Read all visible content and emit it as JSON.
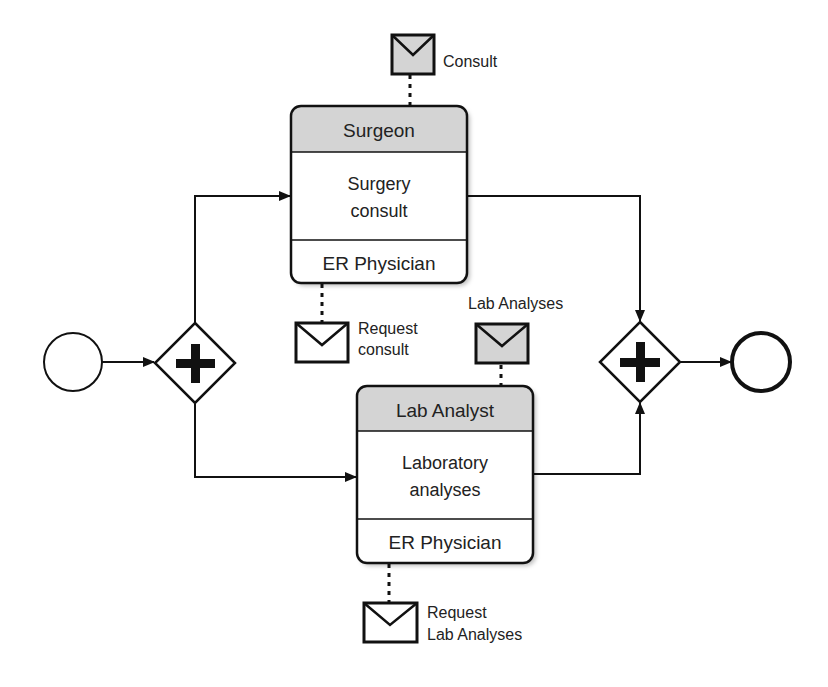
{
  "diagram": {
    "type": "BPMN choreography",
    "colors": {
      "stroke": "#111111",
      "header_fill": "#d4d4d4",
      "envelope_fill_initiating": "#ffffff",
      "envelope_fill_return": "#d4d4d4",
      "background": "#ffffff"
    },
    "start_event": {
      "label": ""
    },
    "end_event": {
      "label": ""
    },
    "split_gateway": {
      "type": "parallel",
      "symbol": "+"
    },
    "join_gateway": {
      "type": "parallel",
      "symbol": "+"
    },
    "tasks": [
      {
        "id": "surgery",
        "top_participant": "Surgeon",
        "name_line1": "Surgery",
        "name_line2": "consult",
        "bottom_participant": "ER Physician",
        "top_message": {
          "label": "Consult",
          "shaded": true
        },
        "bottom_message": {
          "label_line1": "Request",
          "label_line2": "consult",
          "shaded": false
        }
      },
      {
        "id": "lab",
        "top_participant": "Lab Analyst",
        "name_line1": "Laboratory",
        "name_line2": "analyses",
        "bottom_participant": "ER Physician",
        "top_message": {
          "label": "Lab Analyses",
          "shaded": true
        },
        "bottom_message": {
          "label_line1": "Request",
          "label_line2": "Lab Analyses",
          "shaded": false
        }
      }
    ]
  }
}
